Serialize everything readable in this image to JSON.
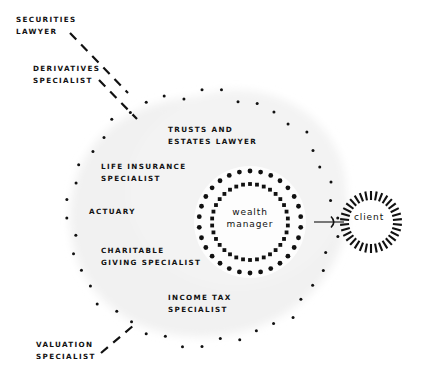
{
  "diagram": {
    "background_color": "#ffffff",
    "ink_color": "#111111",
    "cloud_fill": "#f2f2f2",
    "center_node": {
      "name": "wealth-manager",
      "label": "wealth\nmanager",
      "ring_style": "double-dotted"
    },
    "client_node": {
      "name": "client",
      "label": "client",
      "ring_style": "radial-dashes"
    },
    "connector": {
      "name": "arrow-wealth-manager-to-client",
      "direction": "right"
    },
    "inner_specialists": [
      {
        "id": "trusts-estates-lawyer",
        "label": "TRUSTS AND\nESTATES LAWYER"
      },
      {
        "id": "life-insurance-specialist",
        "label": "LIFE INSURANCE\nSPECIALIST"
      },
      {
        "id": "actuary",
        "label": "ACTUARY"
      },
      {
        "id": "charitable-giving-specialist",
        "label": "CHARITABLE\nGIVING SPECIALIST"
      },
      {
        "id": "income-tax-specialist",
        "label": "INCOME TAX\nSPECIALIST"
      }
    ],
    "outer_specialists": [
      {
        "id": "securities-lawyer",
        "label": "SECURITIES\nLAWYER",
        "leader": "dashed"
      },
      {
        "id": "derivatives-specialist",
        "label": "DERIVATIVES\nSPECIALIST",
        "leader": "dashed"
      },
      {
        "id": "valuation-specialist",
        "label": "VALUATION\nSPECIALIST",
        "leader": "dashed"
      }
    ]
  }
}
